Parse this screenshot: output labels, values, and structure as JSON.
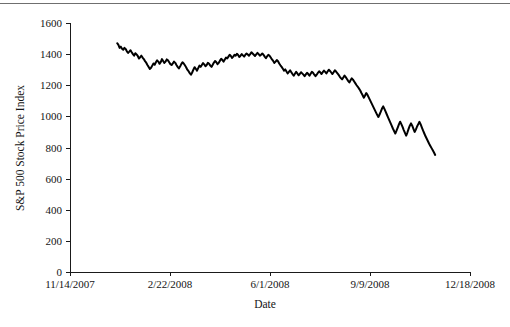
{
  "chart_data": {
    "type": "line",
    "title": "",
    "xlabel": "Date",
    "ylabel": "S&P 500 Stock Price Index",
    "ylim": [
      0,
      1600
    ],
    "yticks": [
      0,
      200,
      400,
      600,
      800,
      1000,
      1200,
      1400,
      1600
    ],
    "ytick_labels": [
      "0",
      "200",
      "400",
      "600",
      "800",
      "1000",
      "1200",
      "1400",
      "1600"
    ],
    "xlim": [
      "11/14/2007",
      "12/18/2008"
    ],
    "xticks": [
      "11/14/2007",
      "2/22/2008",
      "6/1/2008",
      "9/9/2008",
      "12/18/2008"
    ],
    "xtick_labels": [
      "11/14/2007",
      "2/22/2008",
      "6/1/2008",
      "9/9/2008",
      "12/18/2008"
    ],
    "grid": false,
    "legend": null,
    "line_color": "#000000",
    "line_width": 2,
    "series": [
      {
        "name": "S&P 500 Stock Price Index",
        "x_start_fraction": 0.118,
        "x_end_fraction": 0.913,
        "values": [
          1470,
          1460,
          1440,
          1448,
          1435,
          1428,
          1440,
          1433,
          1418,
          1408,
          1416,
          1425,
          1412,
          1400,
          1390,
          1406,
          1398,
          1388,
          1372,
          1380,
          1390,
          1378,
          1368,
          1355,
          1345,
          1330,
          1318,
          1305,
          1312,
          1326,
          1340,
          1332,
          1348,
          1360,
          1352,
          1338,
          1348,
          1368,
          1356,
          1344,
          1352,
          1366,
          1360,
          1348,
          1336,
          1330,
          1340,
          1352,
          1344,
          1330,
          1318,
          1308,
          1320,
          1336,
          1348,
          1340,
          1328,
          1316,
          1300,
          1290,
          1278,
          1268,
          1282,
          1300,
          1316,
          1306,
          1294,
          1310,
          1326,
          1318,
          1330,
          1342,
          1334,
          1322,
          1330,
          1344,
          1338,
          1326,
          1318,
          1332,
          1346,
          1356,
          1348,
          1336,
          1344,
          1358,
          1370,
          1362,
          1352,
          1366,
          1378,
          1372,
          1384,
          1396,
          1388,
          1376,
          1384,
          1396,
          1390,
          1402,
          1394,
          1382,
          1390,
          1400,
          1392,
          1384,
          1396,
          1404,
          1398,
          1390,
          1400,
          1412,
          1404,
          1396,
          1388,
          1398,
          1408,
          1400,
          1390,
          1396,
          1404,
          1396,
          1384,
          1374,
          1386,
          1396,
          1390,
          1378,
          1366,
          1356,
          1344,
          1352,
          1362,
          1354,
          1340,
          1328,
          1318,
          1306,
          1294,
          1302,
          1288,
          1276,
          1286,
          1296,
          1284,
          1272,
          1262,
          1274,
          1286,
          1276,
          1264,
          1272,
          1284,
          1276,
          1268,
          1258,
          1270,
          1280,
          1272,
          1262,
          1274,
          1286,
          1280,
          1268,
          1258,
          1268,
          1280,
          1290,
          1282,
          1272,
          1284,
          1294,
          1286,
          1276,
          1288,
          1300,
          1292,
          1282,
          1272,
          1284,
          1296,
          1288,
          1278,
          1268,
          1256,
          1246,
          1238,
          1250,
          1262,
          1252,
          1240,
          1228,
          1218,
          1232,
          1244,
          1236,
          1224,
          1212,
          1200,
          1190,
          1178,
          1166,
          1150,
          1136,
          1120,
          1134,
          1150,
          1138,
          1122,
          1106,
          1090,
          1074,
          1058,
          1042,
          1026,
          1010,
          996,
          1012,
          1030,
          1050,
          1064,
          1048,
          1030,
          1012,
          994,
          976,
          958,
          940,
          922,
          906,
          890,
          908,
          928,
          948,
          966,
          950,
          932,
          912,
          894,
          876,
          896,
          920,
          940,
          955,
          940,
          920,
          900,
          915,
          935,
          950,
          965,
          948,
          928,
          908,
          890,
          872,
          856,
          840,
          824,
          810,
          796,
          782,
          768,
          752
        ],
        "start_value": 1470,
        "peak_value": 1425,
        "min_value": 752,
        "end_value": 752
      }
    ]
  },
  "axes": {
    "y_axis_title": "S&P 500 Stock Price Index",
    "x_axis_title": "Date"
  }
}
